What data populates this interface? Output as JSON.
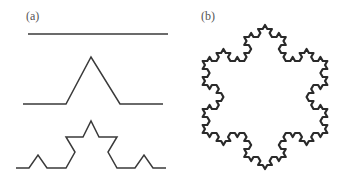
{
  "figure": {
    "panels": [
      {
        "label": "(a)",
        "description": "Koch curve construction, iterations 0-2",
        "curves": [
          {
            "iteration": 0,
            "points": [
              [
                28,
                34
              ],
              [
                168,
                34
              ]
            ]
          },
          {
            "iteration": 1,
            "points": [
              [
                23,
                104
              ],
              [
                66,
                104
              ],
              [
                91,
                57
              ],
              [
                120,
                104
              ],
              [
                163,
                104
              ]
            ]
          },
          {
            "iteration": 2,
            "points": [
              [
                16,
                168
              ],
              [
                29,
                168
              ],
              [
                38,
                155
              ],
              [
                47,
                168
              ],
              [
                66,
                168
              ],
              [
                75,
                152
              ],
              [
                66,
                137
              ],
              [
                83,
                137
              ],
              [
                91,
                121
              ],
              [
                99,
                137
              ],
              [
                117,
                137
              ],
              [
                108,
                152
              ],
              [
                117,
                168
              ],
              [
                135,
                168
              ],
              [
                144,
                155
              ],
              [
                153,
                168
              ],
              [
                166,
                168
              ]
            ]
          }
        ]
      },
      {
        "label": "(b)",
        "description": "Koch snowflake",
        "snowflake": {
          "center": [
            265,
            97
          ],
          "radius": 72,
          "order": 3
        }
      }
    ],
    "stroke_color": "#3a3a3a",
    "snowflake_color": "#2a2a2a"
  }
}
